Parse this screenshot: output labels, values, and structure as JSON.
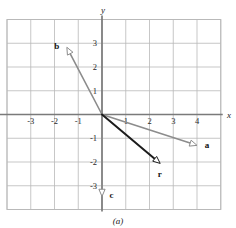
{
  "figure": {
    "caption": "(a)",
    "axis_x_label": "x",
    "axis_y_label": "y"
  },
  "chart_data": {
    "type": "scatter",
    "title": "",
    "xlabel": "x",
    "ylabel": "y",
    "xlim": [
      -4,
      5
    ],
    "ylim": [
      -4,
      4
    ],
    "grid": true,
    "grid_step": 1,
    "legend": "none",
    "xticks": [
      -3,
      -2,
      -1,
      1,
      2,
      3,
      4
    ],
    "yticks": [
      3,
      2,
      1,
      -1,
      -2,
      -3
    ],
    "xtick_labels": [
      "-3",
      "-2",
      "-1",
      "1",
      "2",
      "3",
      "4"
    ],
    "ytick_labels": [
      "3",
      "2",
      "1",
      "-1",
      "-2",
      "-3"
    ],
    "vectors": [
      {
        "name": "a",
        "label": "a",
        "start": [
          0,
          0
        ],
        "end": [
          4.0,
          -1.3
        ],
        "color": "#8c8c8c",
        "width": 1.6,
        "label_offset": [
          0.42,
          0.02
        ]
      },
      {
        "name": "b",
        "label": "b",
        "start": [
          0,
          0
        ],
        "end": [
          -1.48,
          2.83
        ],
        "color": "#8c8c8c",
        "width": 1.6,
        "label_offset": [
          -0.42,
          0.08
        ]
      },
      {
        "name": "c",
        "label": "c",
        "start": [
          0,
          0
        ],
        "end": [
          0,
          -3.45
        ],
        "color": "#8c8c8c",
        "width": 1.6,
        "label_offset": [
          0.4,
          0.06
        ]
      },
      {
        "name": "r",
        "label": "r",
        "start": [
          0,
          0
        ],
        "end": [
          2.45,
          -2.06
        ],
        "color": "#1c1c1c",
        "width": 2.0,
        "label_offset": [
          -0.02,
          -0.45
        ]
      }
    ],
    "colors": {
      "grid": "#b9b9b9",
      "axis": "#7a7a7a",
      "border": "#b9b9b9",
      "vector_gray": "#8c8c8c",
      "vector_black": "#1c1c1c",
      "background": "#ffffff"
    }
  }
}
